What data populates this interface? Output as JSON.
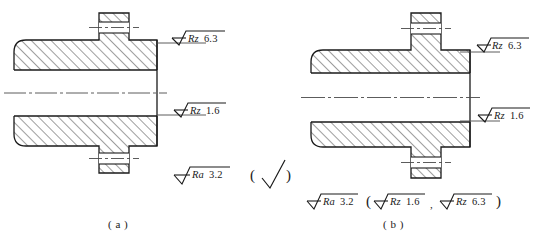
{
  "figure": {
    "type": "engineering-drawing",
    "background_color": "#ffffff",
    "line_color": "#1a1a1a",
    "hatch_color": "#1a1a1a",
    "centerline_color": "#4a4a4a"
  },
  "panels": [
    {
      "id": "a",
      "caption": "( a )",
      "caption_text": "a",
      "annotations": [
        {
          "name": "rz-63",
          "symbol": "surface-roughness-triangle",
          "parameter": "Rz",
          "value": "6.3",
          "leader": "horizontal-to-upper-right-edge"
        },
        {
          "name": "rz-16",
          "symbol": "surface-roughness-triangle",
          "parameter": "Rz",
          "value": "1.6",
          "leader": "horizontal-to-lower-right-edge"
        },
        {
          "name": "ra-32",
          "symbol": "surface-roughness-triangle",
          "parameter": "Ra",
          "value": "3.2",
          "leader": "none"
        }
      ],
      "general_symbol": {
        "open_paren": "(",
        "glyph": "basic-roughness-check",
        "close_paren": ")"
      }
    },
    {
      "id": "b",
      "caption": "( b )",
      "caption_text": "b",
      "annotations": [
        {
          "name": "rz-63",
          "symbol": "surface-roughness-triangle",
          "parameter": "Rz",
          "value": "6.3",
          "leader": "horizontal-to-upper-right-edge"
        },
        {
          "name": "rz-16",
          "symbol": "surface-roughness-triangle",
          "parameter": "Rz",
          "value": "1.6",
          "leader": "horizontal-to-lower-right-edge"
        },
        {
          "name": "ra-32",
          "symbol": "surface-roughness-triangle",
          "parameter": "Ra",
          "value": "3.2",
          "leader": "none"
        }
      ],
      "bracket_group": {
        "open_paren": "(",
        "separator": ",",
        "close_paren": ")",
        "items": [
          {
            "parameter": "Rz",
            "value": "1.6"
          },
          {
            "parameter": "Rz",
            "value": "6.3"
          }
        ]
      }
    }
  ],
  "labels": {
    "rz": "Rz",
    "ra": "Ra",
    "v_63": "6.3",
    "v_16": "1.6",
    "v_32": "3.2",
    "open_paren": "(",
    "close_paren": ")",
    "comma": ",",
    "caption_a": "( a )",
    "caption_b": "( b )"
  }
}
